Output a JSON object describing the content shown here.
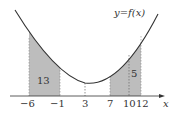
{
  "diagram": {
    "curve_label": "y=f(x)",
    "axis_label": "x",
    "ticks": [
      "−6",
      "−1",
      "3",
      "7",
      "10",
      "12"
    ],
    "regions": [
      {
        "from": "-6",
        "to": "-1",
        "area_label": "13"
      },
      {
        "from": "7",
        "to": "12",
        "area_label": "5"
      }
    ],
    "colors": {
      "shade": "#b8b8b8",
      "curve": "#333333",
      "axis": "#333333"
    }
  }
}
